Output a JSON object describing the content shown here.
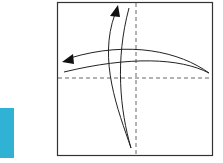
{
  "step": {
    "number": "1",
    "color": "#2fb2d4"
  },
  "diagram": {
    "paper": {
      "x": 57,
      "y": 2,
      "size": 155,
      "border": "#333333"
    },
    "folds": [
      {
        "type": "valley-dashed",
        "orientation": "vertical"
      },
      {
        "type": "valley-dashed",
        "orientation": "horizontal"
      }
    ],
    "arrows": [
      {
        "direction": "up",
        "meaning": "fold-and-unfold"
      },
      {
        "direction": "left",
        "meaning": "fold-and-unfold"
      }
    ]
  }
}
